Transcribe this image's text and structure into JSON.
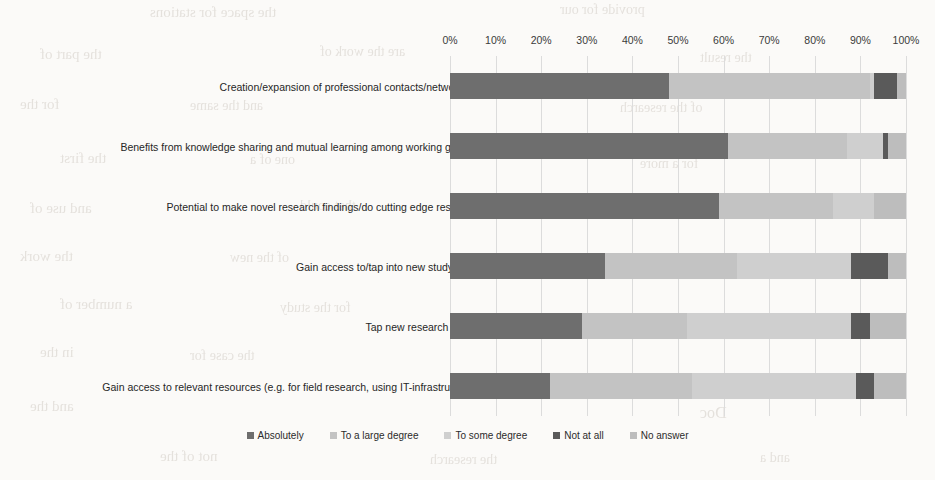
{
  "chart_data": {
    "type": "bar",
    "subtype": "100% stacked horizontal bar",
    "title": "",
    "xlabel": "",
    "ylabel": "",
    "xlim": [
      0,
      100
    ],
    "grid": true,
    "legend_position": "bottom",
    "tick_labels": [
      "0%",
      "10%",
      "20%",
      "30%",
      "40%",
      "50%",
      "60%",
      "70%",
      "80%",
      "90%",
      "100%"
    ],
    "tick_values": [
      0,
      10,
      20,
      30,
      40,
      50,
      60,
      70,
      80,
      90,
      100
    ],
    "categories": [
      "Creation/expansion of professional contacts/networking",
      "Benefits from knowledge sharing and mutual learning among working groups",
      "Potential to make novel research findings/do cutting edge research",
      "Gain access to/tap into new study area",
      "Tap new research funds",
      "Gain access to relevant resources (e.g. for field research, using IT-infrastructure)"
    ],
    "series": [
      {
        "name": "Absolutely",
        "color": "#6e6e6e",
        "values": [
          48,
          61,
          59,
          34,
          29,
          22
        ]
      },
      {
        "name": "To a large degree",
        "color": "#c3c3c3",
        "values": [
          44,
          26,
          25,
          29,
          23,
          31
        ]
      },
      {
        "name": "To some degree",
        "color": "#cfcfcf",
        "values": [
          1,
          8,
          9,
          25,
          36,
          36
        ]
      },
      {
        "name": "Not at all",
        "color": "#5a5a5a",
        "values": [
          5,
          1,
          0,
          8,
          4,
          4
        ]
      },
      {
        "name": "No answer",
        "color": "#bdbdbd",
        "values": [
          2,
          4,
          7,
          4,
          8,
          7
        ]
      }
    ]
  },
  "legend": {
    "items": [
      {
        "label": "Absolutely"
      },
      {
        "label": "To a large degree"
      },
      {
        "label": "To some degree"
      },
      {
        "label": "Not at all"
      },
      {
        "label": "No answer"
      }
    ]
  },
  "scan_artifacts": {
    "bleed_lines": [
      {
        "text": "the space for stations",
        "x": 150,
        "y": 4,
        "size": 15
      },
      {
        "text": "provide for our",
        "x": 560,
        "y": 2,
        "size": 14
      },
      {
        "text": "the part of",
        "x": 40,
        "y": 46,
        "size": 15
      },
      {
        "text": "are the work of",
        "x": 320,
        "y": 44,
        "size": 14
      },
      {
        "text": "the result",
        "x": 700,
        "y": 50,
        "size": 14
      },
      {
        "text": "for the",
        "x": 20,
        "y": 96,
        "size": 15
      },
      {
        "text": "and the same",
        "x": 190,
        "y": 98,
        "size": 14
      },
      {
        "text": "of the research",
        "x": 620,
        "y": 100,
        "size": 14
      },
      {
        "text": "the first",
        "x": 60,
        "y": 150,
        "size": 15
      },
      {
        "text": "one of a",
        "x": 250,
        "y": 152,
        "size": 14
      },
      {
        "text": "for a more",
        "x": 640,
        "y": 156,
        "size": 14
      },
      {
        "text": "and use of",
        "x": 30,
        "y": 200,
        "size": 15
      },
      {
        "text": "that could",
        "x": 300,
        "y": 198,
        "size": 14
      },
      {
        "text": "the work",
        "x": 20,
        "y": 248,
        "size": 15
      },
      {
        "text": "of the new",
        "x": 230,
        "y": 250,
        "size": 14
      },
      {
        "text": "a number of",
        "x": 60,
        "y": 296,
        "size": 15
      },
      {
        "text": "for the study",
        "x": 280,
        "y": 300,
        "size": 14
      },
      {
        "text": "in the",
        "x": 40,
        "y": 344,
        "size": 15
      },
      {
        "text": "the case for",
        "x": 190,
        "y": 348,
        "size": 14
      },
      {
        "text": "and the",
        "x": 30,
        "y": 398,
        "size": 15
      },
      {
        "text": "Doc",
        "x": 700,
        "y": 404,
        "size": 16
      },
      {
        "text": "not of the",
        "x": 160,
        "y": 448,
        "size": 15
      },
      {
        "text": "the research",
        "x": 430,
        "y": 452,
        "size": 14
      },
      {
        "text": "and a",
        "x": 760,
        "y": 450,
        "size": 14
      }
    ]
  }
}
